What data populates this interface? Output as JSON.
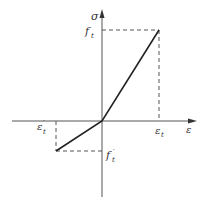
{
  "diagram": {
    "type": "stress-strain bilinear diagram",
    "colors": {
      "line": "#222222",
      "axis": "#555555",
      "dashed": "#555555",
      "text": "#333333",
      "background": "#ffffff"
    },
    "axes": {
      "y_label": "σ",
      "x_label": "ε"
    },
    "labels": {
      "tensile_strength": "f",
      "tensile_strength_sub": "t",
      "tensile_strain": "ε",
      "tensile_strain_sub": "t",
      "compressive_strength": "f",
      "compressive_strength_sub": "t",
      "compressive_strength_prime": "′",
      "compressive_strain": "ε",
      "compressive_strain_sub": "t",
      "compressive_strain_prime": "′"
    },
    "points": {
      "origin": [
        102,
        121
      ],
      "tension_peak": [
        159,
        30
      ],
      "compression_peak": [
        56,
        151
      ]
    }
  }
}
